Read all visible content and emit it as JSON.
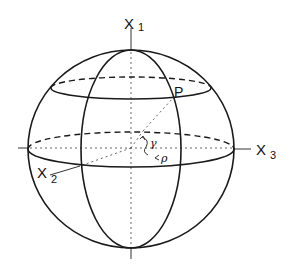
{
  "diagram": {
    "type": "sphere-coordinate-system",
    "colors": {
      "stroke": "#1a1a1a",
      "background": "#ffffff"
    },
    "axes": {
      "x1": {
        "base": "X",
        "sub": "1"
      },
      "x2": {
        "base": "X",
        "sub": "2"
      },
      "x3": {
        "base": "X",
        "sub": "3"
      }
    },
    "point": {
      "label": "P"
    },
    "angles": {
      "gamma": "γ",
      "rho": "ρ"
    }
  }
}
